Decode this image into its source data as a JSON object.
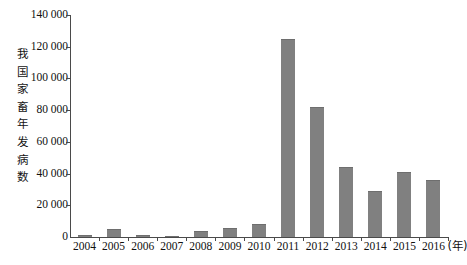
{
  "chart_data": {
    "type": "bar",
    "title": "",
    "subtitle": "",
    "ylabel": "我国家畜年发病数",
    "xlabel": "(年)",
    "categories": [
      "2004",
      "2005",
      "2006",
      "2007",
      "2008",
      "2009",
      "2010",
      "2011",
      "2012",
      "2013",
      "2014",
      "2015",
      "2016"
    ],
    "values": [
      1000,
      5000,
      1200,
      500,
      4000,
      5500,
      8000,
      125000,
      82000,
      44000,
      29000,
      41000,
      36000
    ],
    "ylim": [
      0,
      140000
    ],
    "ytick_labels": [
      "0",
      "20 000",
      "40 000",
      "60 000",
      "80 000",
      "100 000",
      "120 000",
      "140 000"
    ],
    "ytick_values": [
      0,
      20000,
      40000,
      60000,
      80000,
      100000,
      120000,
      140000
    ],
    "grid": false,
    "legend": null,
    "bar_color": "#808080",
    "axis_color": "#4a4a4a",
    "annotations": []
  },
  "axis": {
    "x_unit_label": "(年)"
  }
}
